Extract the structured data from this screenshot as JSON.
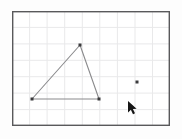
{
  "app": {
    "title": "Geometry Canvas",
    "background_color": "#fdfdfd"
  },
  "plot": {
    "name": "grid-plot-area",
    "left": 12,
    "top": 11,
    "right": 170,
    "bottom": 126,
    "background_color": "#ffffff",
    "border_color": "#59595b",
    "border_width": 1.4,
    "grid": {
      "color": "#e9e9ea",
      "width": 1,
      "visible": true,
      "cell_width": 17.6,
      "cell_height": 16.4,
      "vertical_lines": [
        29.6,
        47.1,
        64.7,
        82.3,
        99.8,
        117.4,
        135.0,
        152.5
      ],
      "horizontal_lines": [
        27.4,
        43.9,
        60.3,
        76.7,
        93.1,
        109.6
      ]
    }
  },
  "shapes": {
    "triangle": {
      "name": "triangle",
      "stroke_color": "#8a8a8c",
      "stroke_width": 1.1,
      "fill": "none",
      "vertices": [
        {
          "label": "A",
          "x": 80,
          "y": 45
        },
        {
          "label": "B",
          "x": 32,
          "y": 99
        },
        {
          "label": "C",
          "x": 99,
          "y": 99
        }
      ]
    },
    "points": [
      {
        "label": "A",
        "x": 80,
        "y": 45,
        "color": "#3a3a3c",
        "size": 3
      },
      {
        "label": "B",
        "x": 32,
        "y": 99,
        "color": "#3a3a3c",
        "size": 3
      },
      {
        "label": "C",
        "x": 99,
        "y": 99,
        "color": "#3a3a3c",
        "size": 3
      },
      {
        "label": "D",
        "x": 137,
        "y": 82,
        "color": "#3a3a3c",
        "size": 3
      }
    ]
  },
  "cursor": {
    "name": "mouse-cursor",
    "x": 128,
    "y": 101,
    "color": "#161616",
    "outline_color": "#ffffff"
  }
}
